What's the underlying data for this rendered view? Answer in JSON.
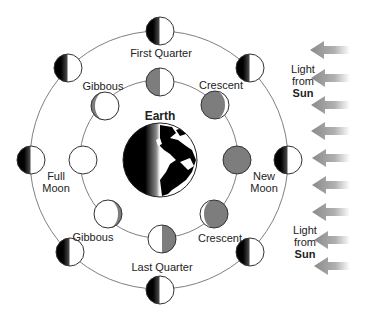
{
  "diagram": {
    "center_label": "Earth",
    "orbit_labels": {
      "first_quarter": "First Quarter",
      "gibbous_top": "Gibbous",
      "crescent_top": "Crescent",
      "full_moon_line1": "Full",
      "full_moon_line2": "Moon",
      "new_moon_line1": "New",
      "new_moon_line2": "Moon",
      "gibbous_bottom": "Gibbous",
      "crescent_bottom": "Crescent",
      "last_quarter": "Last Quarter"
    },
    "sun_labels": [
      {
        "line1": "Light",
        "line2": "from",
        "line3": "Sun"
      },
      {
        "line1": "Light",
        "line2": "from",
        "line3": "Sun"
      }
    ],
    "colors": {
      "orbit": "#777777",
      "dark_side_gray": "#7d7d7d",
      "shadow_black": "#000000",
      "arrow_gray": "#999999",
      "outline": "#333333"
    },
    "inner_ring_moons": [
      {
        "position": "top",
        "phase": "First Quarter (illuminated half right)"
      },
      {
        "position": "top-right",
        "phase": "Crescent"
      },
      {
        "position": "right",
        "phase": "New Moon"
      },
      {
        "position": "bottom-right",
        "phase": "Crescent"
      },
      {
        "position": "bottom",
        "phase": "Last Quarter"
      },
      {
        "position": "bottom-left",
        "phase": "Gibbous"
      },
      {
        "position": "left",
        "phase": "Full Moon"
      },
      {
        "position": "top-left",
        "phase": "Gibbous"
      }
    ],
    "arrow_count": 9
  }
}
